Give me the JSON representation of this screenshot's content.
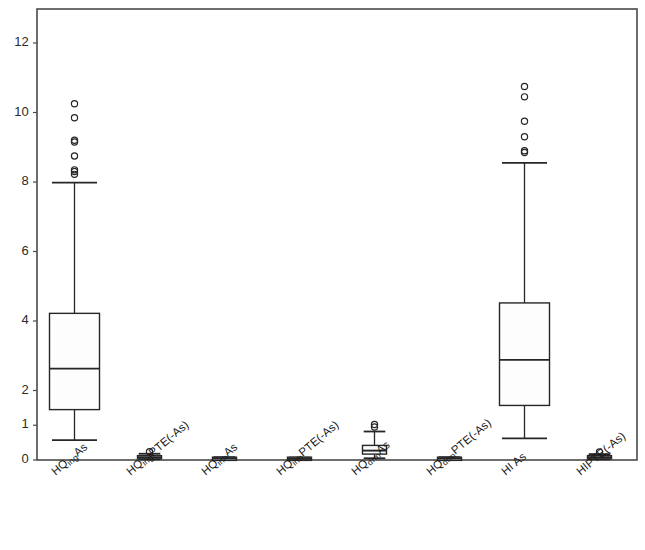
{
  "chart_data": {
    "type": "box",
    "title": "Non-carcinogenic hazard for children",
    "xlabel": "",
    "ylabel": "",
    "ylim": [
      0,
      12.8
    ],
    "yticks": [
      0,
      1,
      2,
      4,
      6,
      8,
      10,
      12
    ],
    "ytick_labels": [
      "0",
      "1",
      "2",
      "4",
      "6",
      "8",
      "10",
      "12"
    ],
    "grid": false,
    "legend": "none",
    "frame": "box",
    "categories": [
      "HQ_ingAs",
      "HQ_ingPTE(-As)",
      "HQ_inhAs",
      "HQ_inhPTE(-As)",
      "HQ_drmAs",
      "HQ_drmPTE(-As)",
      "HI As",
      "HI_PTE(-As)"
    ],
    "category_labels": [
      {
        "base": "HQ",
        "sub": "ing",
        "tail": "As"
      },
      {
        "base": "HQ",
        "sub": "ing",
        "tail": "PTE(-As)"
      },
      {
        "base": "HQ",
        "sub": "inh",
        "tail": "As"
      },
      {
        "base": "HQ",
        "sub": "inh",
        "tail": "PTE(-As)"
      },
      {
        "base": "HQ",
        "sub": "drm",
        "tail": "As"
      },
      {
        "base": "HQ",
        "sub": "drm",
        "tail": "PTE(-As)"
      },
      {
        "base": "HI",
        "sub": "",
        "tail": " As"
      },
      {
        "base": "HI",
        "sub": "",
        "tail": "PTE(-As)"
      }
    ],
    "boxes": [
      {
        "name": "HQ_ingAs",
        "whisker_low": 0.57,
        "q1": 1.45,
        "median": 2.63,
        "q3": 4.22,
        "whisker_high": 7.98,
        "outliers": [
          10.25,
          9.85,
          9.2,
          9.15,
          8.75,
          8.35,
          8.3,
          8.22
        ]
      },
      {
        "name": "HQ_ingPTE(-As)",
        "whisker_low": 0.02,
        "q1": 0.05,
        "median": 0.08,
        "q3": 0.11,
        "whisker_high": 0.18,
        "outliers": [
          0.24
        ]
      },
      {
        "name": "HQ_inhAs",
        "whisker_low": 0.01,
        "q1": 0.02,
        "median": 0.04,
        "q3": 0.05,
        "whisker_high": 0.08,
        "outliers": []
      },
      {
        "name": "HQ_inhPTE(-As)",
        "whisker_low": 0.01,
        "q1": 0.02,
        "median": 0.03,
        "q3": 0.05,
        "whisker_high": 0.07,
        "outliers": []
      },
      {
        "name": "HQ_drmAs",
        "whisker_low": 0.05,
        "q1": 0.17,
        "median": 0.27,
        "q3": 0.42,
        "whisker_high": 0.82,
        "outliers": [
          0.95,
          1.02
        ]
      },
      {
        "name": "HQ_drmPTE(-As)",
        "whisker_low": 0.01,
        "q1": 0.02,
        "median": 0.04,
        "q3": 0.05,
        "whisker_high": 0.08,
        "outliers": []
      },
      {
        "name": "HI As",
        "whisker_low": 0.62,
        "q1": 1.57,
        "median": 2.88,
        "q3": 4.52,
        "whisker_high": 8.55,
        "outliers": [
          10.75,
          10.45,
          9.75,
          9.3,
          8.9,
          8.85
        ]
      },
      {
        "name": "HI_PTE(-As)",
        "whisker_low": 0.02,
        "q1": 0.05,
        "median": 0.08,
        "q3": 0.11,
        "whisker_high": 0.17,
        "outliers": [
          0.23
        ]
      }
    ],
    "colors": {
      "line": "#262626",
      "box_fill": "#fdfdfd",
      "frame": "#4a4a4a",
      "text": "#1a1a1a",
      "background": "#ffffff"
    }
  }
}
